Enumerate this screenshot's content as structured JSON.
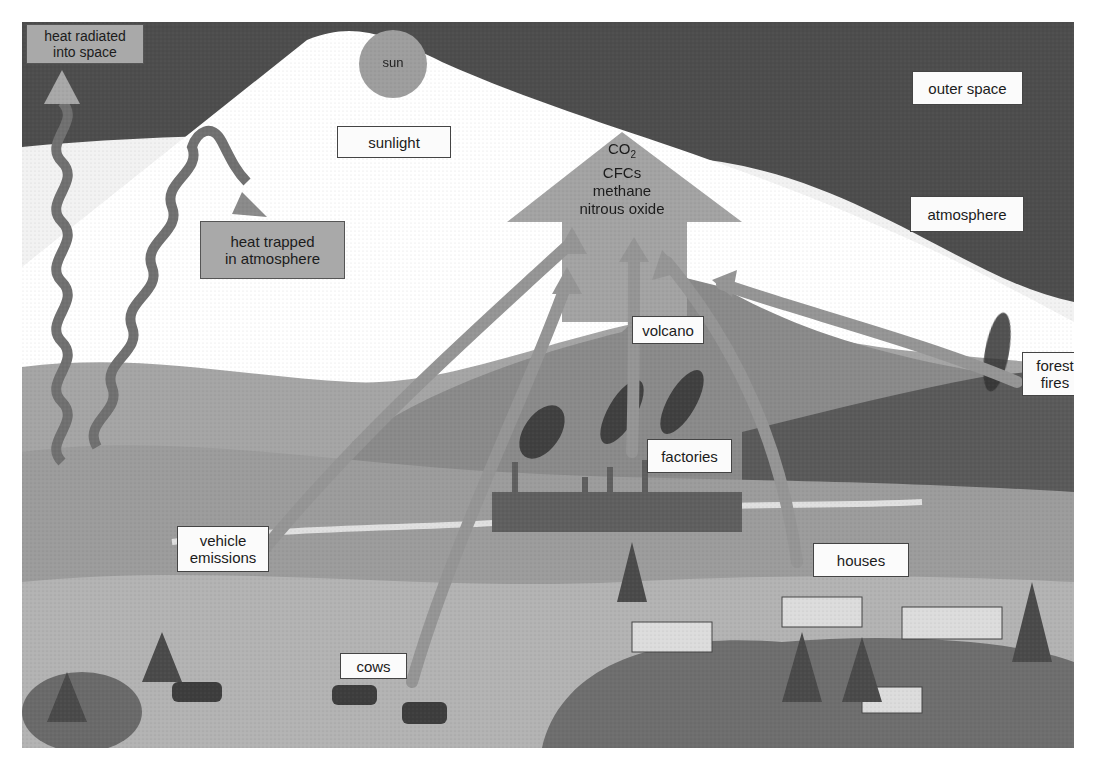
{
  "figure": {
    "regions": {
      "outer_space": "outer space",
      "atmosphere": "atmosphere",
      "sunlight": "sunlight",
      "sun": "sun"
    },
    "heat": {
      "radiated": [
        "heat radiated",
        "into space"
      ],
      "trapped": [
        "heat trapped",
        "in atmosphere"
      ]
    },
    "gases": {
      "co2_base": "CO",
      "co2_sub": "2",
      "items": [
        "CFCs",
        "methane",
        "nitrous oxide"
      ]
    },
    "sources": {
      "volcano": "volcano",
      "factories": "factories",
      "forest_fires": [
        "forest",
        "fires"
      ],
      "vehicle_emissions": [
        "vehicle",
        "emissions"
      ],
      "houses": "houses",
      "cows": "cows"
    },
    "colors": {
      "space": "#4a4a4a",
      "atmosphere": "#f4f4f4",
      "arrow": "#9a9a9a",
      "land": "#8c8c8c",
      "label_bg": "#fbfbfb",
      "label_gray": "#a9a9a9"
    }
  }
}
